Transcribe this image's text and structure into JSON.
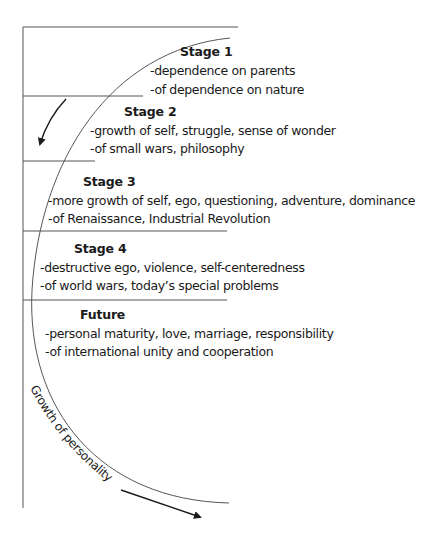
{
  "diagram": {
    "type": "stage-curve",
    "stages": [
      {
        "title": "Stage 1",
        "lines": [
          "-dependence on parents",
          "-of dependence on nature"
        ]
      },
      {
        "title": "Stage 2",
        "lines": [
          "-growth of self, struggle, sense of wonder",
          "-of small wars, philosophy"
        ]
      },
      {
        "title": "Stage 3",
        "lines": [
          "-more growth of self, ego, questioning, adventure, dominance",
          "-of Renaissance, Industrial Revolution"
        ]
      },
      {
        "title": "Stage 4",
        "lines": [
          "-destructive ego, violence, self-centeredness",
          "-of world wars, today’s special problems"
        ]
      },
      {
        "title": "Future",
        "lines": [
          "-personal maturity, love, marriage, responsibility",
          "-of international unity and cooperation"
        ]
      }
    ],
    "curve_label": "Growth of personality",
    "icons": [
      "curved-arrow-down-left-icon",
      "curved-arrow-right-icon"
    ],
    "colors": {
      "ink": "#1a1a1a",
      "rule": "#555555",
      "background": "#ffffff"
    }
  }
}
